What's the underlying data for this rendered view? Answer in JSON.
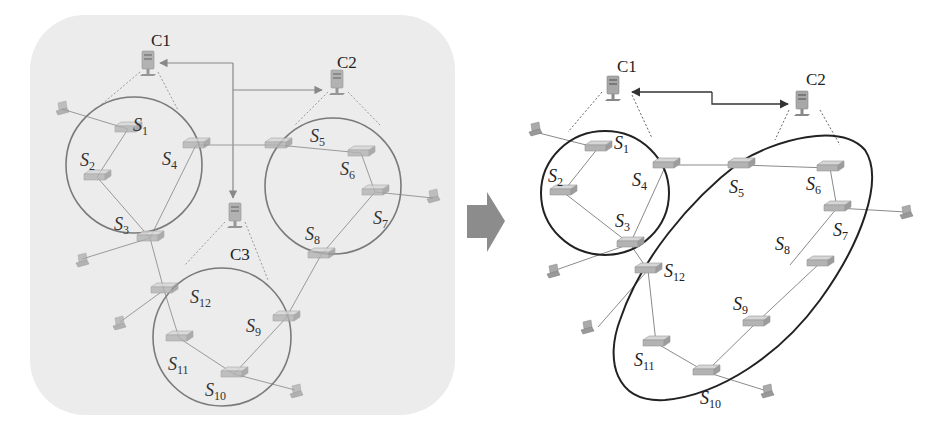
{
  "figure": {
    "left_panel": {
      "controllers": [
        {
          "id": "C1",
          "label": "C1"
        },
        {
          "id": "C2",
          "label": "C2"
        },
        {
          "id": "C3",
          "label": "C3"
        }
      ],
      "switches": [
        {
          "id": "S1",
          "base": "S",
          "sub": "1"
        },
        {
          "id": "S2",
          "base": "S",
          "sub": "2"
        },
        {
          "id": "S3",
          "base": "S",
          "sub": "3"
        },
        {
          "id": "S4",
          "base": "S",
          "sub": "4"
        },
        {
          "id": "S5",
          "base": "S",
          "sub": "5"
        },
        {
          "id": "S6",
          "base": "S",
          "sub": "6"
        },
        {
          "id": "S7",
          "base": "S",
          "sub": "7"
        },
        {
          "id": "S8",
          "base": "S",
          "sub": "8"
        },
        {
          "id": "S9",
          "base": "S",
          "sub": "9"
        },
        {
          "id": "S10",
          "base": "S",
          "sub": "10"
        },
        {
          "id": "S11",
          "base": "S",
          "sub": "11"
        },
        {
          "id": "S12",
          "base": "S",
          "sub": "12"
        }
      ],
      "domains": [
        {
          "controller": "C1",
          "switches": [
            "S1",
            "S2",
            "S3",
            "S4"
          ]
        },
        {
          "controller": "C2",
          "switches": [
            "S5",
            "S6",
            "S7",
            "S8"
          ]
        },
        {
          "controller": "C3",
          "switches": [
            "S9",
            "S10",
            "S11",
            "S12"
          ]
        }
      ]
    },
    "transition_arrow": "right-arrow",
    "right_panel": {
      "controllers": [
        {
          "id": "C1",
          "label": "C1"
        },
        {
          "id": "C2",
          "label": "C2"
        }
      ],
      "domains": [
        {
          "controller": "C1",
          "switches": [
            "S1",
            "S2",
            "S3",
            "S4"
          ]
        },
        {
          "controller": "C2",
          "switches": [
            "S5",
            "S6",
            "S7",
            "S8",
            "S9",
            "S10",
            "S11",
            "S12"
          ]
        }
      ]
    },
    "colors": {
      "left_panel_background": "#ececec",
      "left_ring": "#7a7a7a",
      "right_ring": "#222222",
      "arrow": "#8c8c8c"
    }
  }
}
